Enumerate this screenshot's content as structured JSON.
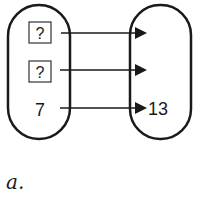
{
  "diagram": {
    "type": "mapping-diagram",
    "domain_items": [
      {
        "value": "?",
        "boxed": true
      },
      {
        "value": "?",
        "boxed": true
      },
      {
        "value": "7",
        "boxed": false
      }
    ],
    "range_items": [
      {
        "value": ""
      },
      {
        "value": ""
      },
      {
        "value": "13"
      }
    ],
    "caption": "a."
  },
  "colors": {
    "stroke": "#1a1a1a",
    "background": "#ffffff"
  }
}
